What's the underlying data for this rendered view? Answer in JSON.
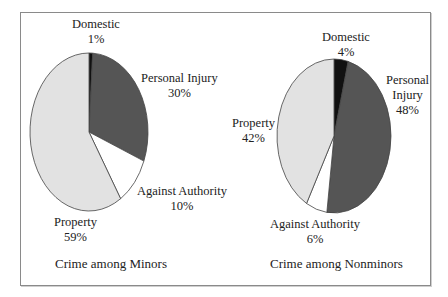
{
  "chart_data": [
    {
      "type": "pie",
      "title": "Crime among Minors",
      "categories": [
        "Domestic",
        "Personal Injury",
        "Against Authority",
        "Property"
      ],
      "values": [
        1,
        30,
        10,
        59
      ],
      "labels": [
        "Domestic\n1%",
        "Personal Injury\n30%",
        "Against Authority\n10%",
        "Property\n59%"
      ],
      "colors": [
        "#111111",
        "#555555",
        "#ffffff",
        "#e2e2e2"
      ],
      "start_angle": "12 o'clock, clockwise",
      "legend": "none (direct labels)"
    },
    {
      "type": "pie",
      "title": "Crime among Nonminors",
      "categories": [
        "Domestic",
        "Personal Injury",
        "Against Authority",
        "Property"
      ],
      "values": [
        4,
        48,
        6,
        42
      ],
      "labels": [
        "Domestic\n4%",
        "Personal\nInjury\n48%",
        "Against Authority\n6%",
        "Property\n42%"
      ],
      "colors": [
        "#111111",
        "#555555",
        "#ffffff",
        "#e2e2e2"
      ],
      "start_angle": "12 o'clock, clockwise",
      "legend": "none (direct labels)"
    }
  ],
  "minors": {
    "caption": "Crime among Minors",
    "domestic": {
      "name": "Domestic",
      "pct": "1%"
    },
    "personal_injury": {
      "name": "Personal Injury",
      "pct": "30%"
    },
    "against_authority": {
      "name": "Against Authority",
      "pct": "10%"
    },
    "property": {
      "name": "Property",
      "pct": "59%"
    }
  },
  "nonminors": {
    "caption": "Crime among Nonminors",
    "domestic": {
      "name": "Domestic",
      "pct": "4%"
    },
    "personal_injury": {
      "name1": "Personal",
      "name2": "Injury",
      "pct": "48%"
    },
    "against_authority": {
      "name": "Against Authority",
      "pct": "6%"
    },
    "property": {
      "name": "Property",
      "pct": "42%"
    }
  }
}
